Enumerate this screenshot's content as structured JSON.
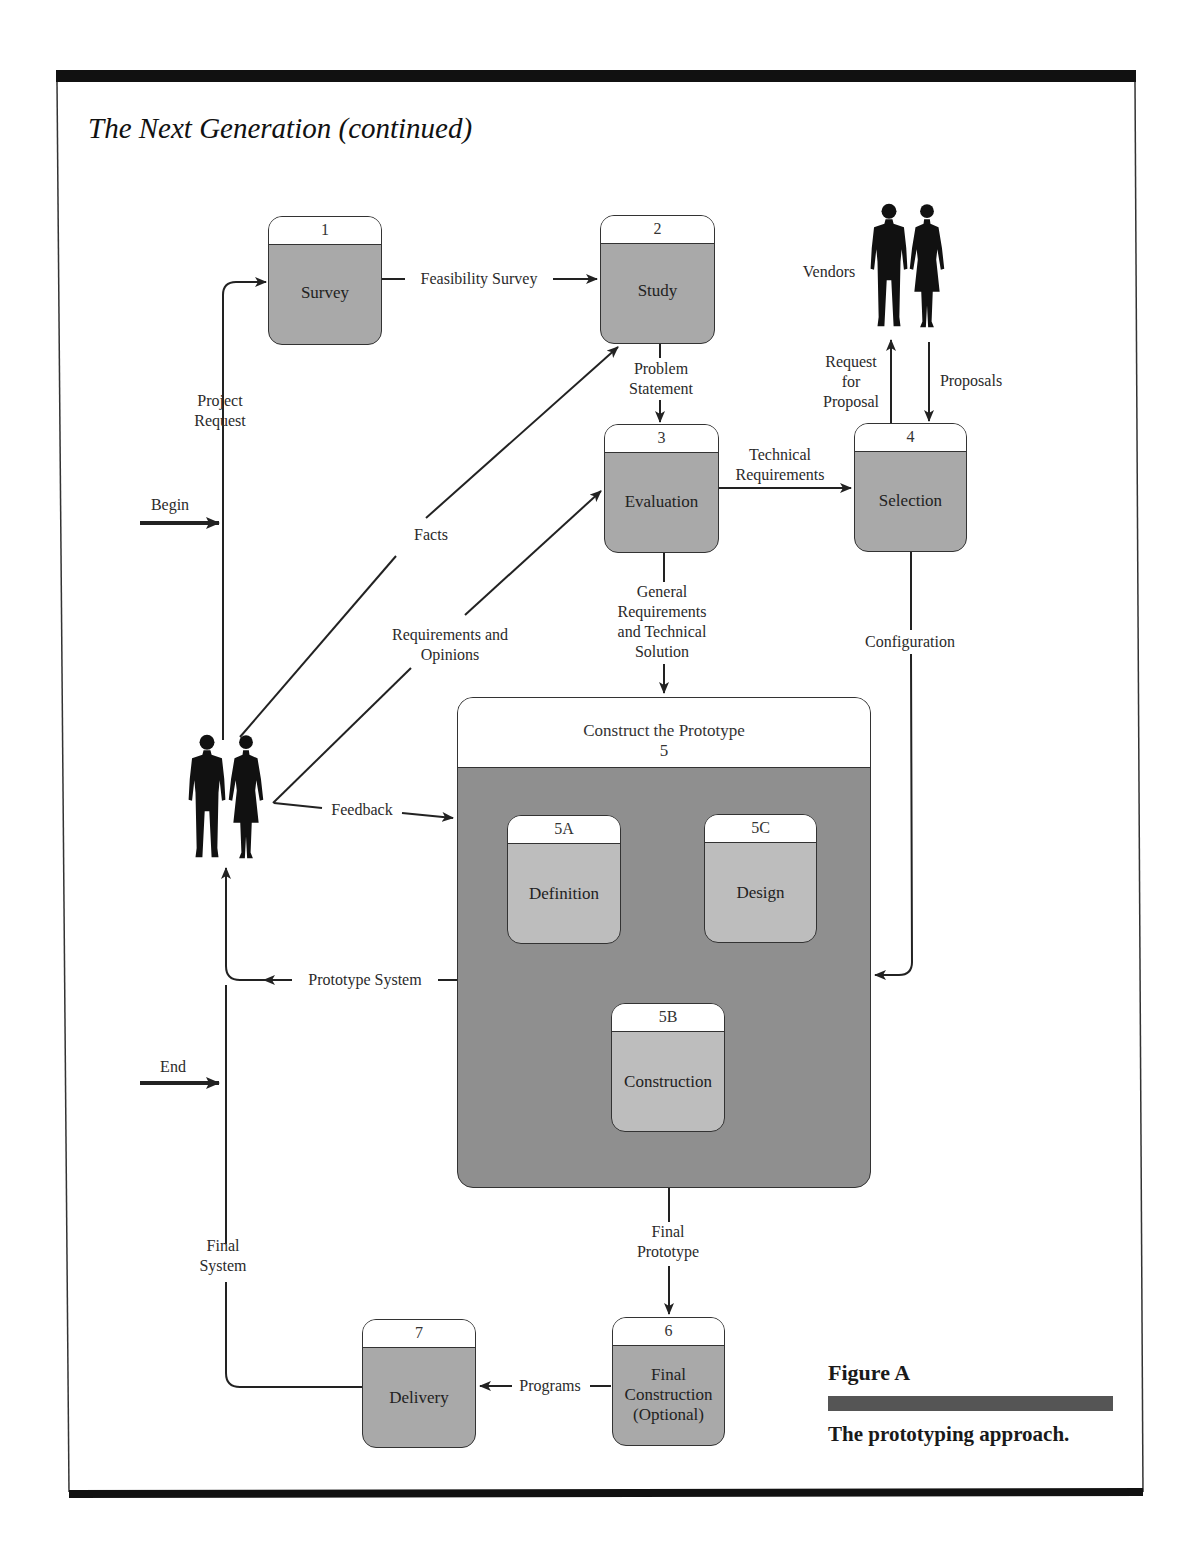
{
  "page": {
    "title": "The Next Generation (continued)"
  },
  "caption": {
    "figure": "Figure A",
    "text": "The prototyping approach."
  },
  "processes": [
    {
      "id": "1",
      "name": "Survey"
    },
    {
      "id": "2",
      "name": "Study"
    },
    {
      "id": "3",
      "name": "Evaluation"
    },
    {
      "id": "4",
      "name": "Selection"
    },
    {
      "id": "5",
      "name": "Construct the Prototype"
    },
    {
      "id": "6",
      "name": "Final Construction (Optional)",
      "lines": [
        "Final",
        "Construction",
        "(Optional)"
      ]
    },
    {
      "id": "7",
      "name": "Delivery"
    }
  ],
  "subprocesses": [
    {
      "id": "5A",
      "name": "Definition"
    },
    {
      "id": "5B",
      "name": "Construction"
    },
    {
      "id": "5C",
      "name": "Design"
    }
  ],
  "actors": {
    "users": "",
    "vendors": "Vendors"
  },
  "flows": {
    "begin": "Begin",
    "end": "End",
    "project_request": [
      "Project",
      "Request"
    ],
    "feasibility_survey": "Feasibility Survey",
    "problem_statement": [
      "Problem",
      "Statement"
    ],
    "technical_requirements": [
      "Technical",
      "Requirements"
    ],
    "request_for_proposal": [
      "Request",
      "for",
      "Proposal"
    ],
    "proposals": "Proposals",
    "facts": "Facts",
    "requirements_opinions": [
      "Requirements and",
      "Opinions"
    ],
    "general_requirements": [
      "General",
      "Requirements",
      "and Technical",
      "Solution"
    ],
    "configuration": "Configuration",
    "feedback": "Feedback",
    "prototype_system": "Prototype System",
    "final_prototype": [
      "Final",
      "Prototype"
    ],
    "programs": "Programs",
    "final_system": [
      "Final",
      "System"
    ]
  }
}
